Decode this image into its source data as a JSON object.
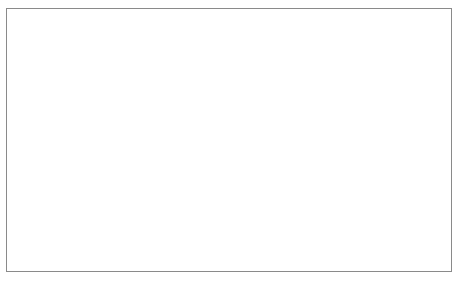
{
  "chart_data": {
    "type": "line",
    "title": "",
    "xlabel": "",
    "ylabel": "Population",
    "x": [
      "1765",
      "1766",
      "1783",
      "1784",
      "1794",
      "1799",
      "1803",
      "1804",
      "1806"
    ],
    "ylim": [
      0,
      800
    ],
    "yticks": [
      0,
      100,
      200,
      300,
      400,
      500,
      600,
      700,
      800
    ],
    "grid": true,
    "legend_position": "right",
    "series": [
      {
        "name": "Opodepe",
        "marker": "filled-diamond",
        "line": "solid",
        "values": [
          528,
          null,
          null,
          null,
          null,
          null,
          355,
          370,
          380
        ]
      },
      {
        "name": "Cucurpe",
        "marker": "open-square",
        "line": "dashed",
        "values": [
          310,
          null,
          null,
          null,
          225,
          465,
          375,
          325,
          340
        ]
      },
      {
        "name": "Sahuaripa",
        "marker": "filled-triangle",
        "line": "solid-dotted",
        "values": [
          null,
          318,
          null,
          null,
          60,
          200,
          85,
          205,
          290
        ]
      },
      {
        "name": "Arivechi",
        "marker": "cross",
        "line": "dotted",
        "values": [
          400,
          432,
          325,
          60,
          465,
          470,
          710,
          512,
          515
        ]
      },
      {
        "name": "Bacadehuachi",
        "marker": "open-triangle",
        "line": "dashed",
        "values": [
          595,
          null,
          null,
          445,
          205,
          250,
          300,
          245,
          200
        ]
      },
      {
        "name": "Guasavas",
        "marker": "filled-circle",
        "line": "solid",
        "values": [
          422,
          458,
          330,
          320,
          335,
          335,
          200,
          200,
          290
        ]
      },
      {
        "name": "Basarac",
        "marker": "open-circle",
        "line": "solid-thin",
        "values": [
          410,
          432,
          328,
          155,
          390,
          468,
          215,
          200,
          95
        ]
      }
    ]
  },
  "legend": {
    "entries": [
      {
        "label": "Opodepe"
      },
      {
        "label": "Cucurpe"
      },
      {
        "label": "Sahuaripa"
      },
      {
        "label": "Arivechi"
      },
      {
        "label": "Bacadehuachi"
      },
      {
        "label": "Guasavas"
      },
      {
        "label": "Basarac"
      }
    ]
  }
}
